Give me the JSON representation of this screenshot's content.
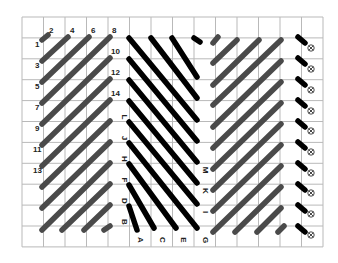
{
  "diagram": {
    "title": "",
    "colors": {
      "background": "#ffffff",
      "grid": "#b9b9b9",
      "grey_stitch": "#4a4a4a",
      "black_stitch": "#000000",
      "label": "#222222"
    },
    "grid": {
      "x0": 22,
      "y0": 17,
      "cols": 14,
      "rows": 11,
      "cell_w": 21.5,
      "cell_h": 20.9
    },
    "sections": [
      {
        "name": "left-grey-stitches",
        "color": "#4a4a4a",
        "width": 5.5,
        "stitches": [
          [
            42,
            40,
            48,
            35
          ],
          [
            42,
            61,
            68,
            37
          ],
          [
            42,
            82,
            89,
            37
          ],
          [
            42,
            103,
            110,
            37
          ],
          [
            42,
            124,
            110,
            58
          ],
          [
            42,
            145,
            110,
            79
          ],
          [
            42,
            166,
            110,
            100
          ],
          [
            42,
            187,
            110,
            121
          ],
          [
            42,
            208,
            110,
            142
          ],
          [
            42,
            230,
            110,
            163
          ],
          [
            62,
            230,
            110,
            184
          ],
          [
            84,
            230,
            110,
            205
          ],
          [
            104,
            230,
            110,
            226
          ]
        ]
      },
      {
        "name": "center-black-stitches",
        "color": "#000000",
        "width": 5.5,
        "stitches": [
          [
            129,
            38,
            197,
            120
          ],
          [
            151,
            38,
            197,
            98
          ],
          [
            172,
            38,
            197,
            77
          ],
          [
            194,
            38,
            200,
            42
          ],
          [
            129,
            59,
            197,
            141
          ],
          [
            129,
            80,
            197,
            162
          ],
          [
            129,
            101,
            197,
            183
          ],
          [
            129,
            122,
            197,
            204
          ],
          [
            129,
            143,
            197,
            228
          ],
          [
            129,
            164,
            176,
            228
          ],
          [
            129,
            185,
            154,
            228
          ],
          [
            129,
            206,
            137,
            230
          ]
        ]
      },
      {
        "name": "right-grey-stitches",
        "color": "#4a4a4a",
        "width": 5.5,
        "stitches": [
          [
            213,
            43,
            218,
            37
          ],
          [
            213,
            63,
            237,
            40
          ],
          [
            213,
            85,
            259,
            40
          ],
          [
            213,
            105,
            281,
            40
          ],
          [
            213,
            127,
            281,
            61
          ],
          [
            213,
            148,
            281,
            82
          ],
          [
            213,
            169,
            281,
            103
          ],
          [
            213,
            190,
            281,
            124
          ],
          [
            213,
            211,
            281,
            145
          ],
          [
            213,
            232,
            281,
            166
          ],
          [
            235,
            232,
            281,
            187
          ],
          [
            257,
            232,
            281,
            208
          ],
          [
            278,
            232,
            284,
            226
          ]
        ]
      },
      {
        "name": "edge-black-short-stitches",
        "color": "#000000",
        "width": 5.5,
        "stitches": [
          [
            298,
            37,
            305,
            43
          ],
          [
            298,
            58,
            305,
            64
          ],
          [
            298,
            79,
            305,
            85
          ],
          [
            298,
            100,
            305,
            106
          ],
          [
            298,
            121,
            305,
            127
          ],
          [
            298,
            142,
            305,
            148
          ],
          [
            298,
            163,
            305,
            169
          ],
          [
            298,
            184,
            305,
            190
          ],
          [
            298,
            205,
            305,
            211
          ],
          [
            298,
            226,
            305,
            232
          ]
        ]
      }
    ],
    "number_labels": [
      {
        "text": "1",
        "x": 35,
        "y": 47
      },
      {
        "text": "2",
        "x": 49,
        "y": 33
      },
      {
        "text": "3",
        "x": 35,
        "y": 68
      },
      {
        "text": "4",
        "x": 70,
        "y": 33
      },
      {
        "text": "5",
        "x": 35,
        "y": 89
      },
      {
        "text": "6",
        "x": 91,
        "y": 33
      },
      {
        "text": "7",
        "x": 35,
        "y": 110
      },
      {
        "text": "8",
        "x": 112,
        "y": 33
      },
      {
        "text": "9",
        "x": 35,
        "y": 131
      },
      {
        "text": "10",
        "x": 111,
        "y": 54
      },
      {
        "text": "11",
        "x": 33,
        "y": 152
      },
      {
        "text": "12",
        "x": 111,
        "y": 75
      },
      {
        "text": "13",
        "x": 33,
        "y": 173
      },
      {
        "text": "14",
        "x": 111,
        "y": 96
      }
    ],
    "letter_labels": [
      {
        "text": "L",
        "x": 122,
        "y": 117
      },
      {
        "text": "J",
        "x": 122,
        "y": 138
      },
      {
        "text": "H",
        "x": 122,
        "y": 159
      },
      {
        "text": "F",
        "x": 122,
        "y": 180
      },
      {
        "text": "D",
        "x": 122,
        "y": 201
      },
      {
        "text": "B",
        "x": 122,
        "y": 222
      },
      {
        "text": "A",
        "x": 138,
        "y": 240
      },
      {
        "text": "C",
        "x": 160,
        "y": 240
      },
      {
        "text": "E",
        "x": 181,
        "y": 240
      },
      {
        "text": "G",
        "x": 203,
        "y": 240
      },
      {
        "text": "I",
        "x": 203,
        "y": 212
      },
      {
        "text": "K",
        "x": 203,
        "y": 191
      },
      {
        "text": "M",
        "x": 203,
        "y": 170
      }
    ],
    "cross_symbols": {
      "x": 311,
      "ys": [
        48,
        69,
        90,
        111,
        131,
        152,
        173,
        193,
        214,
        235
      ],
      "glyph": "⊗"
    }
  }
}
